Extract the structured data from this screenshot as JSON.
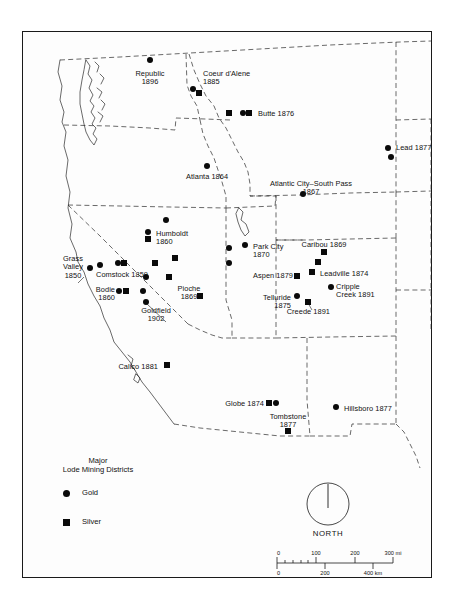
{
  "map": {
    "title": "Major Lode Mining Districts of the American West",
    "background_color": "#fdfdfd",
    "frame_color": "#1a1a1a",
    "marker_color": "#0a0a0a",
    "districts": [
      {
        "name": "Republic",
        "year": "1896",
        "label": "Republic\n1896",
        "x": 150,
        "y": 66,
        "lx": 150,
        "ly": 70,
        "align": "c",
        "markers": [
          {
            "type": "gold",
            "x": 150,
            "y": 60
          }
        ]
      },
      {
        "name": "Coeur d'Alene",
        "year": "1885",
        "label": "Coeur d'Alene\n1885",
        "x": 196,
        "y": 87,
        "lx": 203,
        "ly": 70,
        "align": "l",
        "markers": [
          {
            "type": "gold",
            "x": 193,
            "y": 89
          },
          {
            "type": "silver",
            "x": 199,
            "y": 93
          }
        ]
      },
      {
        "name": "Butte",
        "year": "1876",
        "label": "Butte 1876",
        "x": 250,
        "y": 112,
        "lx": 258,
        "ly": 110,
        "align": "l",
        "markers": [
          {
            "type": "silver",
            "x": 229,
            "y": 113
          },
          {
            "type": "gold",
            "x": 243,
            "y": 113
          },
          {
            "type": "silver",
            "x": 249,
            "y": 113
          }
        ]
      },
      {
        "name": "Lead",
        "year": "1877",
        "label": "Lead 1877",
        "x": 389,
        "y": 147,
        "lx": 396,
        "ly": 144,
        "align": "l",
        "markers": [
          {
            "type": "gold",
            "x": 388,
            "y": 148
          },
          {
            "type": "gold",
            "x": 391,
            "y": 157
          }
        ]
      },
      {
        "name": "Atlanta",
        "year": "1864",
        "label": "Atlanta 1864",
        "x": 207,
        "y": 167,
        "lx": 207,
        "ly": 173,
        "align": "c",
        "markers": [
          {
            "type": "gold",
            "x": 207,
            "y": 166
          }
        ]
      },
      {
        "name": "Atlantic City–South Pass",
        "year": "1867",
        "label": "Atlantic City–South Pass\n1867",
        "x": 308,
        "y": 190,
        "lx": 311,
        "ly": 180,
        "align": "c",
        "markers": [
          {
            "type": "gold",
            "x": 303,
            "y": 194
          }
        ]
      },
      {
        "name": "Humboldt",
        "year": "1860",
        "label": "Humboldt\n1860",
        "x": 149,
        "y": 236,
        "lx": 156,
        "ly": 230,
        "align": "l",
        "markers": [
          {
            "type": "gold",
            "x": 148,
            "y": 232
          },
          {
            "type": "silver",
            "x": 148,
            "y": 239
          },
          {
            "type": "gold",
            "x": 166,
            "y": 220
          }
        ]
      },
      {
        "name": "Park City",
        "year": "1870",
        "label": "Park City\n1870",
        "x": 247,
        "y": 246,
        "lx": 253,
        "ly": 243,
        "align": "l",
        "markers": [
          {
            "type": "gold",
            "x": 245,
            "y": 245
          },
          {
            "type": "gold",
            "x": 229,
            "y": 248
          },
          {
            "type": "gold",
            "x": 229,
            "y": 263
          }
        ]
      },
      {
        "name": "Caribou",
        "year": "1869",
        "label": "Caribou 1869",
        "x": 324,
        "y": 249,
        "lx": 324,
        "ly": 241,
        "align": "c",
        "markers": [
          {
            "type": "silver",
            "x": 324,
            "y": 252
          },
          {
            "type": "silver",
            "x": 318,
            "y": 262
          }
        ]
      },
      {
        "name": "Grass Valley",
        "year": "1850",
        "label": "Grass\nValley\n1850",
        "x": 80,
        "y": 270,
        "lx": 73,
        "ly": 255,
        "align": "c",
        "markers": [
          {
            "type": "gold",
            "x": 90,
            "y": 268
          }
        ]
      },
      {
        "name": "Comstock",
        "year": "1859",
        "label": "Comstock 1859",
        "x": 122,
        "y": 265,
        "lx": 122,
        "ly": 271,
        "align": "c",
        "markers": [
          {
            "type": "gold",
            "x": 118,
            "y": 263
          },
          {
            "type": "silver",
            "x": 124,
            "y": 263
          },
          {
            "type": "gold",
            "x": 100,
            "y": 265
          },
          {
            "type": "silver",
            "x": 155,
            "y": 263
          },
          {
            "type": "silver",
            "x": 175,
            "y": 258
          }
        ]
      },
      {
        "name": "Leadville",
        "year": "1874",
        "label": "Leadville 1874",
        "x": 313,
        "y": 273,
        "lx": 320,
        "ly": 270,
        "align": "l",
        "markers": [
          {
            "type": "silver",
            "x": 312,
            "y": 272
          }
        ]
      },
      {
        "name": "Aspen",
        "year": "1879",
        "label": "Aspen 1879",
        "x": 297,
        "y": 275,
        "lx": 293,
        "ly": 272,
        "align": "r",
        "markers": [
          {
            "type": "silver",
            "x": 297,
            "y": 276
          }
        ]
      },
      {
        "name": "Cripple Creek",
        "year": "1891",
        "label": "Cripple\nCreek 1891",
        "x": 330,
        "y": 288,
        "lx": 336,
        "ly": 283,
        "align": "l",
        "markers": [
          {
            "type": "gold",
            "x": 331,
            "y": 287
          }
        ]
      },
      {
        "name": "Bodie",
        "year": "1860",
        "label": "Bodie\n1860",
        "x": 121,
        "y": 289,
        "lx": 115,
        "ly": 286,
        "align": "r",
        "markers": [
          {
            "type": "gold",
            "x": 119,
            "y": 291
          },
          {
            "type": "silver",
            "x": 126,
            "y": 291
          },
          {
            "type": "gold",
            "x": 143,
            "y": 291
          },
          {
            "type": "gold",
            "x": 146,
            "y": 277
          }
        ]
      },
      {
        "name": "Pioche",
        "year": "1869",
        "label": "Pioche\n1869",
        "x": 189,
        "y": 290,
        "lx": 189,
        "ly": 285,
        "align": "c",
        "markers": [
          {
            "type": "silver",
            "x": 200,
            "y": 296
          },
          {
            "type": "silver",
            "x": 169,
            "y": 277
          }
        ]
      },
      {
        "name": "Telluride",
        "year": "1875",
        "label": "Telluride\n1875",
        "x": 297,
        "y": 297,
        "lx": 291,
        "ly": 294,
        "align": "r",
        "markers": [
          {
            "type": "gold",
            "x": 297,
            "y": 296
          }
        ]
      },
      {
        "name": "Creede",
        "year": "1891",
        "label": "Creede 1891",
        "x": 305,
        "y": 312,
        "lx": 330,
        "ly": 308,
        "align": "r",
        "markers": [
          {
            "type": "silver",
            "x": 308,
            "y": 302
          }
        ]
      },
      {
        "name": "Goldfield",
        "year": "1902",
        "label": "Goldfield\n1902",
        "x": 140,
        "y": 313,
        "lx": 156,
        "ly": 307,
        "align": "c",
        "markers": [
          {
            "type": "gold",
            "x": 146,
            "y": 302
          }
        ]
      },
      {
        "name": "Calico",
        "year": "1881",
        "label": "Calico 1881",
        "x": 162,
        "y": 366,
        "lx": 158,
        "ly": 363,
        "align": "r",
        "markers": [
          {
            "type": "silver",
            "x": 167,
            "y": 365
          }
        ]
      },
      {
        "name": "Globe",
        "year": "1874",
        "label": "Globe 1874",
        "x": 268,
        "y": 403,
        "lx": 264,
        "ly": 400,
        "align": "r",
        "markers": [
          {
            "type": "silver",
            "x": 269,
            "y": 403
          },
          {
            "type": "gold",
            "x": 276,
            "y": 403
          }
        ]
      },
      {
        "name": "Tombstone",
        "year": "1877",
        "label": "Tombstone\n1877",
        "x": 288,
        "y": 432,
        "lx": 288,
        "ly": 413,
        "align": "c",
        "markers": [
          {
            "type": "silver",
            "x": 288,
            "y": 431
          }
        ]
      },
      {
        "name": "Hillsboro",
        "year": "1877",
        "label": "Hillsboro 1877",
        "x": 337,
        "y": 408,
        "lx": 344,
        "ly": 405,
        "align": "l",
        "markers": [
          {
            "type": "gold",
            "x": 336,
            "y": 407
          }
        ]
      }
    ],
    "legend": {
      "title": "Major\nLode Mining Districts",
      "title_x": 98,
      "title_y": 456,
      "items": [
        {
          "label": "Gold",
          "symbol": "gold-circle",
          "x": 63,
          "y": 490
        },
        {
          "label": "Silver",
          "symbol": "silver-square",
          "x": 63,
          "y": 519
        }
      ]
    },
    "north_arrow": {
      "label": "NORTH",
      "cx": 328,
      "cy": 504,
      "r": 21
    },
    "scale_bar": {
      "miles_unit": "mi",
      "km_unit": "km",
      "miles_labels": [
        "0",
        "100",
        "200",
        "300 mi"
      ],
      "km_labels": [
        "0",
        "200",
        "400 km"
      ],
      "x0": 277,
      "x1": 393,
      "y": 563
    }
  }
}
